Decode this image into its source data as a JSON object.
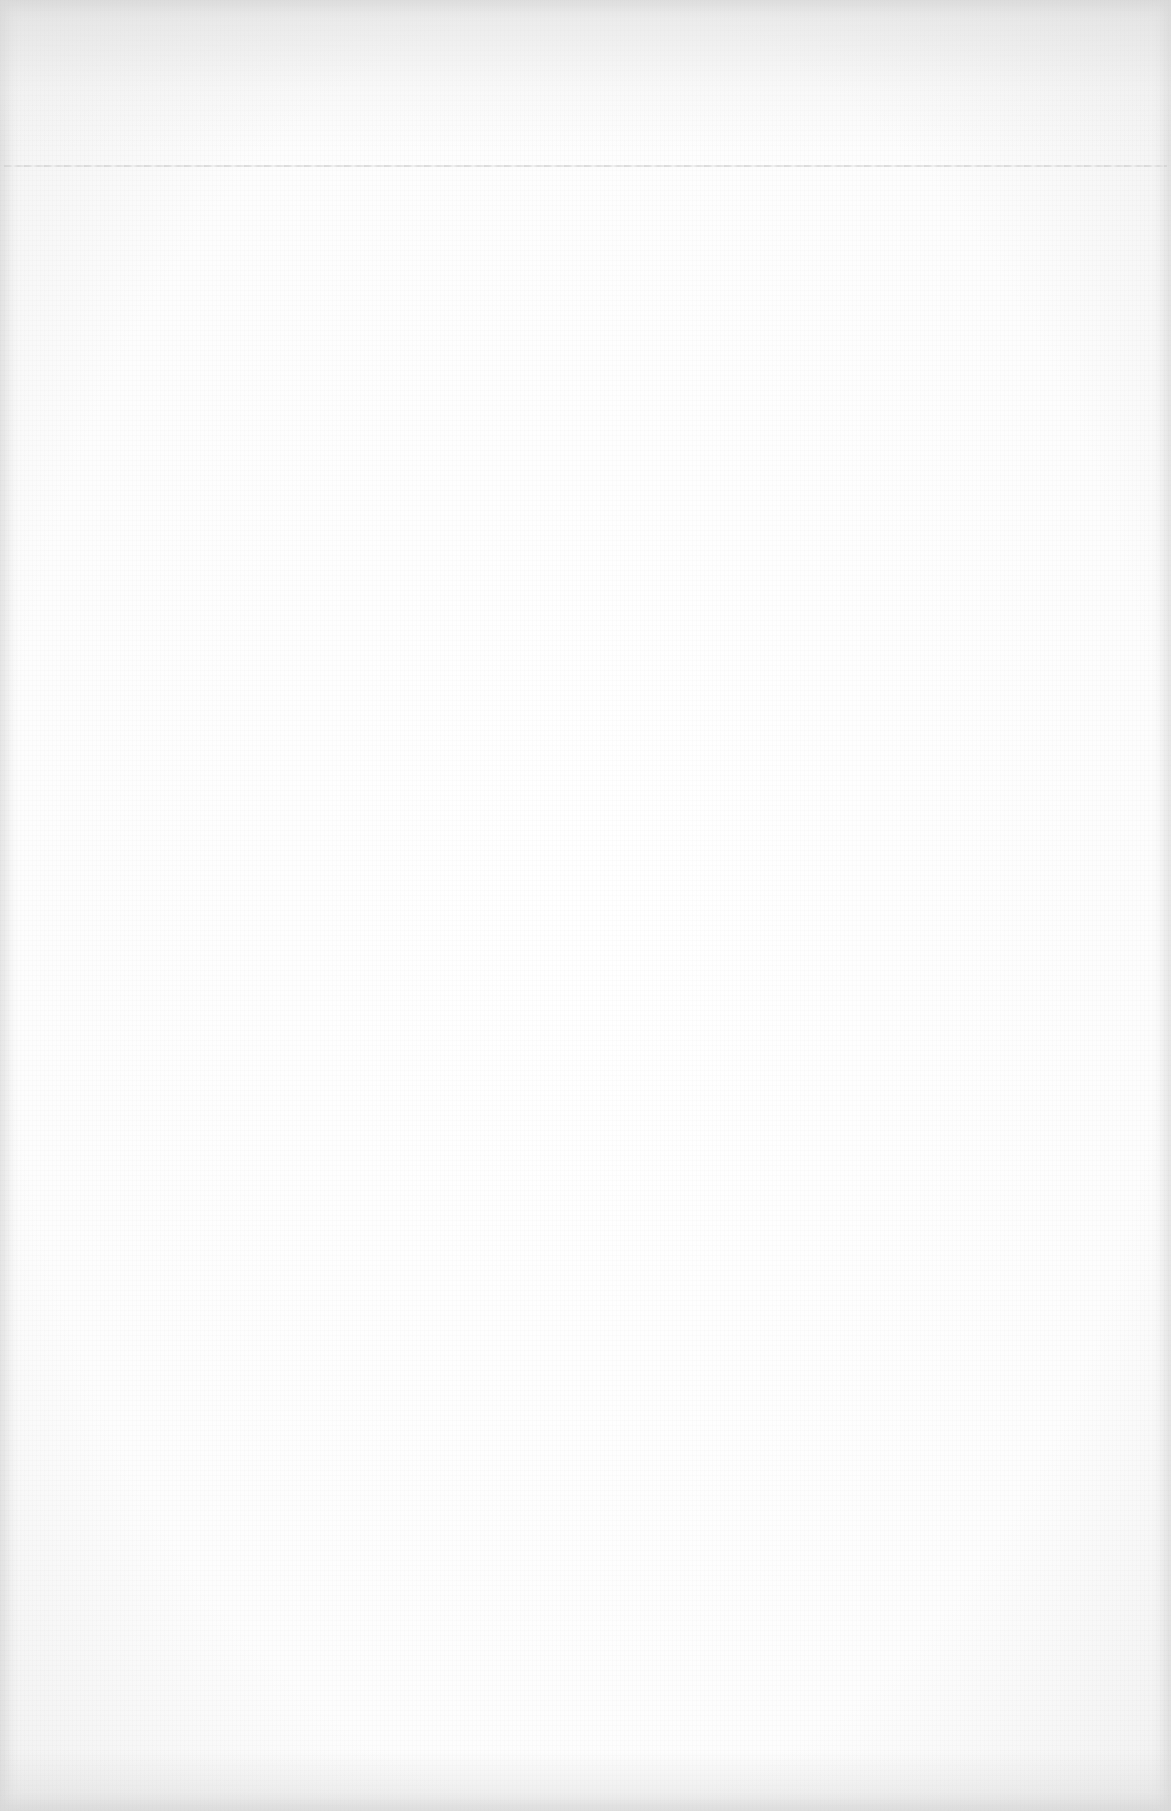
{
  "document": {
    "type": "blank-scanned-page",
    "text": "",
    "ruled_line": {
      "visible": true,
      "y": 165
    },
    "colors": {
      "paper": "#fefefe",
      "edge_shadow": "#e6e6e6",
      "ruled_line": "#d4d4d4"
    }
  }
}
